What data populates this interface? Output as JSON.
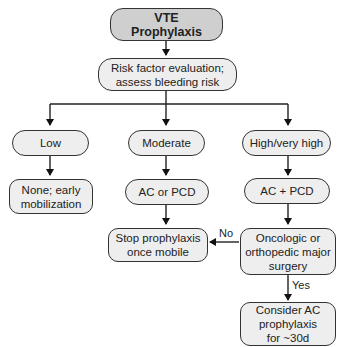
{
  "flowchart": {
    "title": "VTE\nProphylaxis",
    "evaluation": "Risk factor evaluation;\nassess bleeding risk",
    "risk_levels": {
      "low": "Low",
      "moderate": "Moderate",
      "high": "High/very high"
    },
    "actions": {
      "low": "None; early\nmobilization",
      "moderate": "AC or PCD",
      "high": "AC + PCD"
    },
    "stop": "Stop prophylaxis\nonce mobile",
    "decision": "Oncologic or\northopedic major\nsurgery",
    "extended": "Consider AC\nprophylaxis\nfor ~30d",
    "edge_labels": {
      "no": "No",
      "yes": "Yes"
    }
  }
}
